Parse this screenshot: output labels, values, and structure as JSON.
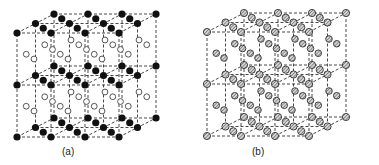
{
  "figure": {
    "panels": [
      {
        "id": "a",
        "caption": "(a)",
        "lattice": {
          "cells_x": 3,
          "cells_depth": 2,
          "cells_y": 2
        },
        "corner_atom_style": "filled-black",
        "face_atom_style": "open-circle"
      },
      {
        "id": "b",
        "caption": "(b)",
        "lattice": {
          "cells_x": 3,
          "cells_depth": 2,
          "cells_y": 2
        },
        "corner_atom_style": "hatched",
        "face_atom_style": "hatched"
      }
    ],
    "colors": {
      "line": "#333333",
      "filled_atom": "#111111",
      "open_atom_stroke": "#444444",
      "hatched_atom_fill": "#bdbdbd",
      "hatched_atom_stroke": "#333333"
    }
  }
}
